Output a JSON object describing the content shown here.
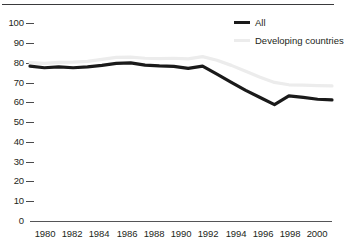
{
  "chart_data": {
    "type": "line",
    "title": "",
    "subtitle": "",
    "xlabel": "",
    "ylabel": "",
    "x": [
      1980,
      1981,
      1982,
      1983,
      1984,
      1985,
      1986,
      1987,
      1988,
      1989,
      1990,
      1991,
      1992,
      1993,
      1994,
      1995,
      1996,
      1997,
      1998,
      1999,
      2000,
      2001
    ],
    "xlim": [
      1980,
      2001
    ],
    "ylim": [
      0,
      100
    ],
    "xticks": [
      1980,
      1982,
      1984,
      1986,
      1988,
      1990,
      1992,
      1994,
      1996,
      1998,
      2000
    ],
    "xtick_labels": [
      "1980",
      "1982",
      "1984",
      "1986",
      "1988",
      "1990",
      "1992",
      "1994",
      "1996",
      "1998",
      "2000"
    ],
    "yticks": [
      0,
      10,
      20,
      30,
      40,
      50,
      60,
      70,
      80,
      90,
      100
    ],
    "ytick_labels": [
      "0",
      "10",
      "20",
      "30",
      "40",
      "50",
      "60",
      "70",
      "80",
      "90",
      "100"
    ],
    "grid": false,
    "legend_position": "top-right",
    "series": [
      {
        "name": "All",
        "color": "#1a1a1a",
        "width": 3.2,
        "values": [
          78.2,
          77.4,
          77.8,
          77.4,
          77.8,
          78.6,
          79.6,
          79.9,
          78.7,
          78.3,
          78.1,
          77.1,
          78.2,
          74.2,
          70.0,
          66.0,
          62.4,
          58.8,
          63.2,
          62.4,
          61.5,
          61.2
        ]
      },
      {
        "name": "Developing countries",
        "color": "#ececec",
        "width": 3.2,
        "values": [
          80.0,
          79.6,
          80.1,
          80.2,
          80.6,
          81.6,
          82.6,
          82.8,
          82.2,
          82.0,
          82.2,
          81.9,
          83.0,
          81.2,
          78.6,
          75.6,
          72.6,
          70.0,
          68.8,
          68.6,
          68.4,
          68.2
        ]
      }
    ]
  },
  "legend": {
    "items": [
      {
        "label": "All",
        "color": "#1a1a1a"
      },
      {
        "label": "Developing countries",
        "color": "#ececec"
      }
    ]
  },
  "axes": {
    "y_labels": [
      "100",
      "90",
      "80",
      "70",
      "60",
      "50",
      "40",
      "30",
      "20",
      "10",
      "0"
    ],
    "x_labels": [
      "1980",
      "1982",
      "1984",
      "1986",
      "1988",
      "1990",
      "1992",
      "1994",
      "1996",
      "1998",
      "2000"
    ]
  }
}
